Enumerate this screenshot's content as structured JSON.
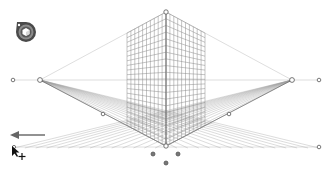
{
  "app": {
    "tool": "Perspective Grid Tool",
    "grid_type": "two-point perspective"
  },
  "colors": {
    "background": "#ffffff",
    "grid_line": "#8a8a8a",
    "guide_line": "#c8c8c8",
    "handle_fill": "#ffffff",
    "handle_stroke": "#555555",
    "widget_outer": "#4a4a4a",
    "widget_inner": "#8c8c8c",
    "arrow": "#777777"
  },
  "grid": {
    "horizon_y": 80,
    "ground_y": 146,
    "top_vertex": {
      "x": 166,
      "y": 12
    },
    "bottom_vertex": {
      "x": 166,
      "y": 146
    },
    "left_vanishing_point": {
      "x": 40,
      "y": 80
    },
    "right_vanishing_point": {
      "x": 292,
      "y": 80
    },
    "left_extent_handle": {
      "x": 13,
      "y": 80
    },
    "right_extent_handle": {
      "x": 319,
      "y": 80
    },
    "left_grid_extent_x": 127,
    "right_grid_extent_x": 205,
    "left_midpoint_handle": {
      "x": 103,
      "y": 114
    },
    "right_midpoint_handle": {
      "x": 229,
      "y": 114
    },
    "ground_right_handle": {
      "x": 319,
      "y": 147
    },
    "ground_left_handle": {
      "x": 14,
      "y": 147
    },
    "origin_handles": [
      {
        "x": 153,
        "y": 154
      },
      {
        "x": 178,
        "y": 154
      },
      {
        "x": 166,
        "y": 163
      }
    ]
  },
  "icons": {
    "plane_switching_widget": "cube-widget-icon",
    "direction_arrow": "arrow-left-icon",
    "cursor": "move-cursor-icon"
  }
}
